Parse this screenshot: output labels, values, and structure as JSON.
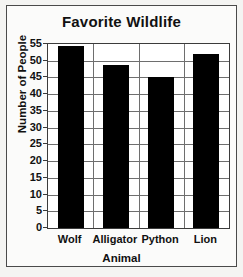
{
  "chart_data": {
    "type": "bar",
    "title": "Favorite Wildlife",
    "xlabel": "Animal",
    "ylabel": "Number of People",
    "categories": [
      "Wolf",
      "Alligator",
      "Python",
      "Lion"
    ],
    "values": [
      54.5,
      48.8,
      45,
      52
    ],
    "ylim": [
      0,
      55
    ],
    "ytick_values": [
      0,
      5,
      10,
      15,
      20,
      25,
      30,
      35,
      40,
      45,
      50,
      55
    ],
    "ytick_labels": [
      "0",
      "5",
      "10",
      "15",
      "20",
      "25",
      "30",
      "35",
      "40",
      "45",
      "50",
      "55"
    ],
    "grid": "horizontal-and-vertical",
    "legend": "none",
    "bar_color": "#000000",
    "plot_background": "#ffffff",
    "frame_color": "#3b3b3b",
    "grid_color": "#6e6e6e"
  }
}
